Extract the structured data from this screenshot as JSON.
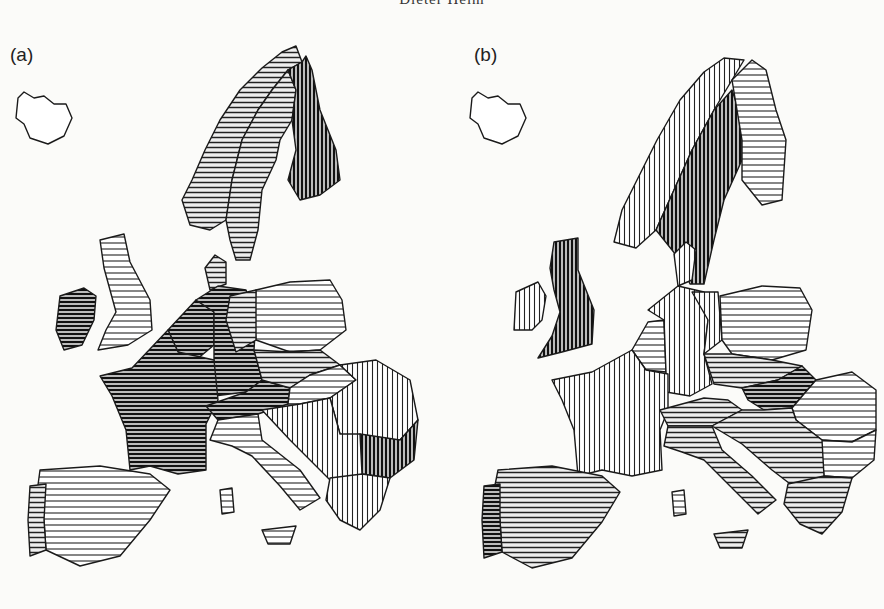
{
  "running_head": "Dieter Helm",
  "panels": [
    {
      "label": "(a)"
    },
    {
      "label": "(b)"
    }
  ],
  "hatch_legend_notes": {
    "h_light": "sparse horizontal hatching",
    "h_dense": "dense horizontal hatching (dark)",
    "v_light": "sparse vertical hatching",
    "v_dense": "dense vertical hatching (dark)"
  },
  "colors": {
    "ink": "#1a1a1a",
    "paper": "#fbfbf9"
  }
}
